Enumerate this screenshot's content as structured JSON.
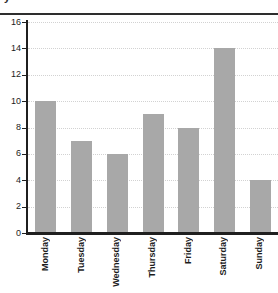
{
  "top_rule_fragment": "y",
  "chart_data": {
    "type": "bar",
    "title": "",
    "subtitle": "",
    "xlabel": "",
    "ylabel": "",
    "categories": [
      "Monday",
      "Tuesday",
      "Wednesday",
      "Thursday",
      "Friday",
      "Saturday",
      "Sunday"
    ],
    "values": [
      10,
      7,
      6,
      9,
      8,
      14,
      4
    ],
    "ylim": [
      0,
      16
    ],
    "ytick_labels": [
      "0",
      "2",
      "4",
      "6",
      "8",
      "10",
      "12",
      "14",
      "16"
    ],
    "ytick_values": [
      0,
      2,
      4,
      6,
      8,
      10,
      12,
      14,
      16
    ],
    "grid": true,
    "grid_style": "dotted",
    "legend": false,
    "legend_position": "none",
    "xtick_rotation": 90,
    "bar_color": "#a8a8a8",
    "axis_color": "#1f1f1f",
    "grid_color": "#d2d2d2",
    "background_color": "#ffffff"
  }
}
